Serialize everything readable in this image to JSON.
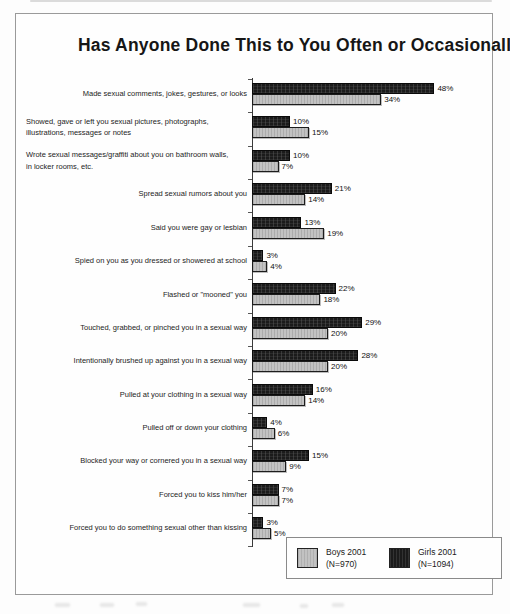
{
  "title": "Has Anyone Done This to You Often or Occasionally",
  "chart_data": {
    "type": "bar",
    "orientation": "horizontal",
    "title": "Has Anyone Done This to You Often or Occasionally",
    "value_suffix": "%",
    "xlim": [
      0,
      50
    ],
    "grid": false,
    "legend_position": "bottom-right",
    "categories": [
      "Made sexual comments, jokes, gestures, or looks",
      "Showed, gave or left you sexual pictures, photographs,\nillustrations, messages or notes",
      "Wrote sexual messages/graffiti about you on bathroom walls,\nin locker rooms, etc.",
      "Spread sexual rumors about you",
      "Said you were gay or lesbian",
      "Spied on you as you dressed or showered at school",
      "Flashed or \"mooned\" you",
      "Touched, grabbed, or pinched you in a sexual way",
      "Intentionally brushed up against you in a sexual way",
      "Pulled at your clothing in a sexual way",
      "Pulled off or down your clothing",
      "Blocked your way or cornered you in a sexual way",
      "Forced you to kiss him/her",
      "Forced you to do something sexual other than kissing"
    ],
    "series": [
      {
        "name": "Girls 2001",
        "n_label": "(N=1094)",
        "color": "#1b1b1b",
        "values": [
          48,
          10,
          10,
          21,
          13,
          3,
          22,
          29,
          28,
          16,
          4,
          15,
          7,
          3
        ]
      },
      {
        "name": "Boys 2001",
        "n_label": "(N=970)",
        "color": "#c2c2c2",
        "values": [
          34,
          15,
          7,
          14,
          19,
          4,
          18,
          20,
          20,
          14,
          6,
          9,
          7,
          5
        ]
      }
    ]
  },
  "legend": {
    "boys": {
      "line1": "Boys 2001",
      "line2": "(N=970)"
    },
    "girls": {
      "line1": "Girls 2001",
      "line2": "(N=1094)"
    }
  }
}
